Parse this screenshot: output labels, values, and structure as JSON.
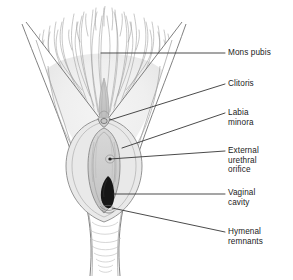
{
  "figure": {
    "kind": "anatomical-illustration",
    "style": "pencil line drawing, grayscale",
    "background_color": "#ffffff",
    "ink_color": "#6b6b6b",
    "dark_fill_color": "#1a1a1a",
    "skin_shade_color": "#e8e8e8",
    "hair_color": "#8f8f8f",
    "leader_line_color": "#2b2b2b",
    "text_color": "#1b1b1b"
  },
  "labels": [
    {
      "id": "mons-pubis",
      "lines": [
        "Mons pubis"
      ],
      "text_x": 228,
      "text_y": 48,
      "leader": {
        "x1": 101,
        "y1": 53,
        "x2": 225,
        "y2": 53
      },
      "anchor_on": "pubic hair mound"
    },
    {
      "id": "clitoris",
      "lines": [
        "Clitoris"
      ],
      "text_x": 228,
      "text_y": 79,
      "leader": {
        "x1": 110,
        "y1": 120,
        "x2": 225,
        "y2": 84
      },
      "anchor_on": "clitoral glans"
    },
    {
      "id": "labia-minora",
      "lines": [
        "Labia",
        "minora"
      ],
      "text_x": 228,
      "text_y": 108,
      "leader": {
        "x1": 122,
        "y1": 148,
        "x2": 225,
        "y2": 113
      },
      "anchor_on": "inner labial fold"
    },
    {
      "id": "external-urethral-orifice",
      "lines": [
        "External",
        "urethral",
        "orifice"
      ],
      "text_x": 228,
      "text_y": 146,
      "leader": {
        "x1": 110,
        "y1": 159,
        "x2": 225,
        "y2": 151
      },
      "anchor_on": "urethral opening"
    },
    {
      "id": "vaginal-cavity",
      "lines": [
        "Vaginal",
        "cavity"
      ],
      "text_x": 228,
      "text_y": 188,
      "leader": {
        "x1": 113,
        "y1": 194,
        "x2": 225,
        "y2": 194
      },
      "anchor_on": "vaginal introitus"
    },
    {
      "id": "hymenal-remnants",
      "lines": [
        "Hymenal",
        "remnants"
      ],
      "text_x": 228,
      "text_y": 227,
      "leader": {
        "x1": 112,
        "y1": 208,
        "x2": 225,
        "y2": 232
      },
      "anchor_on": "hymenal tissue margin"
    }
  ]
}
